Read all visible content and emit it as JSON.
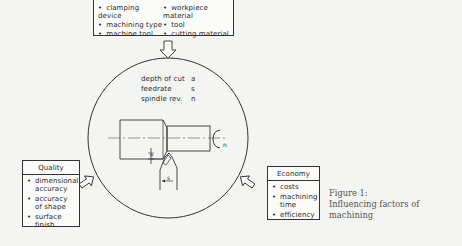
{
  "influences_box": {
    "items": [
      {
        "label": "clamping device"
      },
      {
        "label": "workpiece material"
      },
      {
        "label": "machining type"
      },
      {
        "label": "tool"
      },
      {
        "label": "machine tool"
      },
      {
        "label": "cutting material"
      }
    ]
  },
  "parameters": [
    {
      "name": "depth of cut",
      "symbol": "a"
    },
    {
      "name": "feedrate",
      "symbol": "s"
    },
    {
      "name": "spindle rev.",
      "symbol": "n"
    }
  ],
  "drawing_labels": {
    "depth_symbol": "a",
    "feed_symbol": "s",
    "rotation_symbol": "n"
  },
  "quality_box": {
    "title": "Quality",
    "items": [
      {
        "label": "dimensional\naccuracy"
      },
      {
        "label": "accuracy\nof shape"
      },
      {
        "label": "surface\nfinish"
      }
    ]
  },
  "economy_box": {
    "title": "Economy",
    "items": [
      {
        "label": "costs"
      },
      {
        "label": "machining\ntime"
      },
      {
        "label": "efficiency"
      }
    ]
  },
  "caption": {
    "line1": "Figure 1:",
    "line2": "Influencing factors of",
    "line3": "machining"
  }
}
